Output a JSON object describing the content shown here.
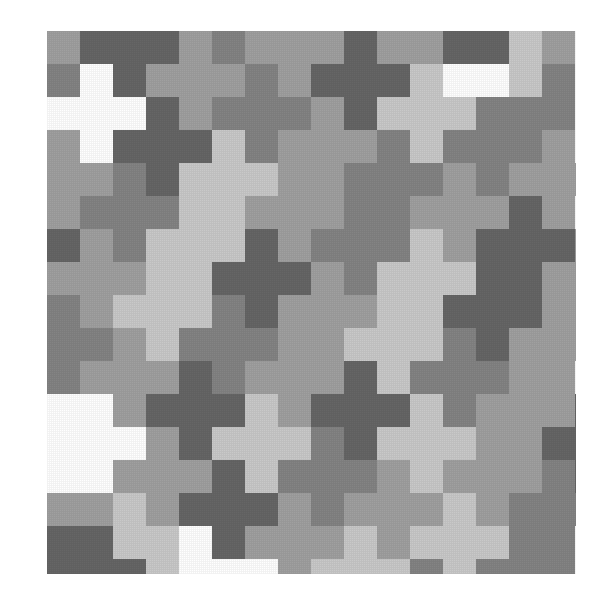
{
  "artwork": {
    "title": "Cross Tessellation Pattern",
    "description": "Greyscale tiling of plus-shaped pentominoes on a diagonal lattice",
    "background_color": "#ffffff"
  },
  "canvas": {
    "image_width": 599,
    "image_height": 594,
    "pattern_left": 47,
    "pattern_top": 31,
    "pattern_width": 529,
    "pattern_height": 543,
    "cell_size": 33,
    "grid_columns": 16,
    "grid_rows": 17
  },
  "palette": {
    "names": [
      "white",
      "light-grey",
      "mid-grey",
      "dark-grey",
      "darkest-grey"
    ],
    "colors": [
      "#ffffff",
      "#c9c9c9",
      "#a0a0a0",
      "#848484",
      "#666666"
    ]
  },
  "chart_data": {
    "type": "heatmap",
    "xlabel": "",
    "ylabel": "",
    "legend": [],
    "grid": false,
    "cell_size": 33,
    "columns": 16,
    "rows": 17,
    "palette": [
      "#ffffff",
      "#c9c9c9",
      "#a0a0a0",
      "#848484",
      "#666666"
    ],
    "note": "Each tile is a plus-pentomino whose centre sits at (col,row); value = palette index",
    "tiles": [
      {
        "col": 0,
        "row": -1,
        "v": 2
      },
      {
        "col": 2,
        "row": 0,
        "v": 4
      },
      {
        "col": 4,
        "row": 1,
        "v": 2
      },
      {
        "col": 6,
        "row": 2,
        "v": 3
      },
      {
        "col": 8,
        "row": 3,
        "v": 2
      },
      {
        "col": 10,
        "row": 4,
        "v": 3
      },
      {
        "col": 12,
        "row": 5,
        "v": 2
      },
      {
        "col": 14,
        "row": 6,
        "v": 4
      },
      {
        "col": 16,
        "row": 7,
        "v": 2
      },
      {
        "col": -1,
        "row": 1,
        "v": 3
      },
      {
        "col": 1,
        "row": 2,
        "v": 0
      },
      {
        "col": 3,
        "row": 3,
        "v": 4
      },
      {
        "col": 5,
        "row": 4,
        "v": 1
      },
      {
        "col": 7,
        "row": 5,
        "v": 2
      },
      {
        "col": 9,
        "row": 6,
        "v": 3
      },
      {
        "col": 11,
        "row": 7,
        "v": 1
      },
      {
        "col": 13,
        "row": 8,
        "v": 4
      },
      {
        "col": 15,
        "row": 9,
        "v": 2
      },
      {
        "col": -2,
        "row": 3,
        "v": 1
      },
      {
        "col": 0,
        "row": 4,
        "v": 2
      },
      {
        "col": 2,
        "row": 5,
        "v": 3
      },
      {
        "col": 4,
        "row": 6,
        "v": 1
      },
      {
        "col": 6,
        "row": 7,
        "v": 4
      },
      {
        "col": 8,
        "row": 8,
        "v": 2
      },
      {
        "col": 10,
        "row": 9,
        "v": 1
      },
      {
        "col": 12,
        "row": 10,
        "v": 3
      },
      {
        "col": 14,
        "row": 11,
        "v": 2
      },
      {
        "col": 16,
        "row": 12,
        "v": 4
      },
      {
        "col": -1,
        "row": 6,
        "v": 4
      },
      {
        "col": 1,
        "row": 7,
        "v": 2
      },
      {
        "col": 3,
        "row": 8,
        "v": 1
      },
      {
        "col": 5,
        "row": 9,
        "v": 3
      },
      {
        "col": 7,
        "row": 10,
        "v": 2
      },
      {
        "col": 9,
        "row": 11,
        "v": 4
      },
      {
        "col": 11,
        "row": 12,
        "v": 1
      },
      {
        "col": 13,
        "row": 13,
        "v": 2
      },
      {
        "col": 15,
        "row": 14,
        "v": 3
      },
      {
        "col": -2,
        "row": 8,
        "v": 2
      },
      {
        "col": 0,
        "row": 9,
        "v": 3
      },
      {
        "col": 2,
        "row": 10,
        "v": 2
      },
      {
        "col": 4,
        "row": 11,
        "v": 4
      },
      {
        "col": 6,
        "row": 12,
        "v": 1
      },
      {
        "col": 8,
        "row": 13,
        "v": 3
      },
      {
        "col": 10,
        "row": 14,
        "v": 2
      },
      {
        "col": 12,
        "row": 15,
        "v": 1
      },
      {
        "col": 14,
        "row": 16,
        "v": 3
      },
      {
        "col": 1,
        "row": 12,
        "v": 0
      },
      {
        "col": 3,
        "row": 13,
        "v": 2
      },
      {
        "col": 5,
        "row": 14,
        "v": 4
      },
      {
        "col": 7,
        "row": 15,
        "v": 2
      },
      {
        "col": 9,
        "row": 16,
        "v": 1
      },
      {
        "col": 11,
        "row": 17,
        "v": 3
      },
      {
        "col": 3,
        "row": -2,
        "v": 1
      },
      {
        "col": 5,
        "row": -1,
        "v": 3
      },
      {
        "col": 7,
        "row": 0,
        "v": 2
      },
      {
        "col": 9,
        "row": 1,
        "v": 4
      },
      {
        "col": 11,
        "row": 2,
        "v": 1
      },
      {
        "col": 13,
        "row": 3,
        "v": 3
      },
      {
        "col": 15,
        "row": 4,
        "v": 2
      }
    ],
    "rows_data": [
      [
        2,
        4,
        4,
        4,
        2,
        3,
        1,
        0,
        3,
        2,
        2,
        2,
        4,
        4,
        1,
        2
      ],
      [
        2,
        0,
        0,
        0,
        4,
        1,
        1,
        0,
        4,
        2,
        2,
        0,
        0,
        0,
        1,
        3
      ],
      [
        1,
        0,
        0,
        0,
        1,
        1,
        4,
        4,
        4,
        3,
        2,
        0,
        0,
        0,
        3,
        3
      ],
      [
        2,
        2,
        0,
        3,
        3,
        1,
        4,
        4,
        4,
        3,
        1,
        1,
        0,
        4,
        4,
        3
      ],
      [
        1,
        1,
        4,
        3,
        3,
        3,
        1,
        0,
        2,
        2,
        1,
        1,
        4,
        4,
        4,
        2
      ],
      [
        1,
        1,
        4,
        4,
        4,
        3,
        2,
        0,
        0,
        0,
        3,
        3,
        4,
        4,
        4,
        2
      ],
      [
        1,
        3,
        4,
        4,
        4,
        1,
        2,
        0,
        0,
        0,
        3,
        3,
        2,
        4,
        2,
        1
      ],
      [
        3,
        3,
        0,
        4,
        1,
        1,
        2,
        2,
        0,
        3,
        3,
        3,
        2,
        2,
        1,
        1
      ],
      [
        3,
        3,
        0,
        0,
        0,
        2,
        2,
        2,
        4,
        4,
        3,
        1,
        1,
        0,
        0,
        0
      ],
      [
        2,
        2,
        0,
        0,
        0,
        3,
        3,
        2,
        4,
        4,
        4,
        1,
        1,
        0,
        0,
        0
      ],
      [
        2,
        4,
        4,
        0,
        2,
        3,
        3,
        2,
        4,
        4,
        4,
        2,
        2,
        0,
        0,
        0
      ],
      [
        0,
        4,
        4,
        1,
        1,
        1,
        3,
        2,
        2,
        4,
        2,
        2,
        2,
        1,
        1,
        3
      ],
      [
        0,
        0,
        4,
        4,
        4,
        1,
        1,
        3,
        3,
        0,
        2,
        1,
        1,
        1,
        3,
        3
      ],
      [
        0,
        0,
        1,
        4,
        4,
        4,
        1,
        3,
        3,
        0,
        0,
        0,
        1,
        1,
        3,
        4
      ],
      [
        2,
        2,
        1,
        4,
        4,
        4,
        2,
        2,
        3,
        0,
        0,
        0,
        1,
        1,
        4,
        4
      ],
      [
        4,
        4,
        1,
        1,
        0,
        2,
        2,
        2,
        3,
        3,
        0,
        4,
        4,
        2,
        4,
        4
      ],
      [
        4,
        4,
        4,
        1,
        0,
        0,
        0,
        2,
        3,
        3,
        4,
        4,
        4,
        2,
        2,
        2
      ]
    ]
  }
}
